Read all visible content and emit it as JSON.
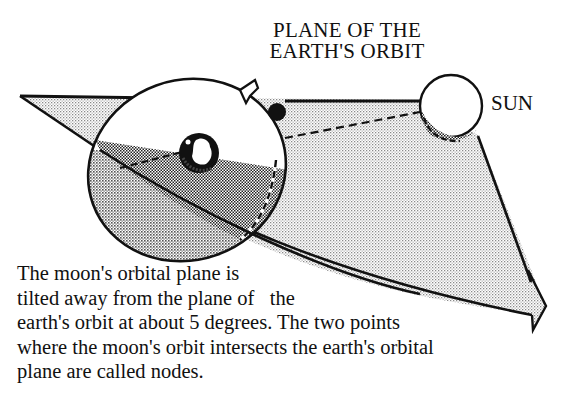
{
  "diagram": {
    "title_lines": [
      "PLANE OF THE",
      "EARTH'S ORBIT"
    ],
    "labels": {
      "sun": "SUN"
    },
    "caption_lines": [
      "The moon's orbital plane is",
      "tilted away from the plane of   the",
      "earth's orbit at about 5 degrees. The two points",
      "where the moon's orbit intersects the earth's orbital",
      "plane are called nodes."
    ],
    "elements": {
      "earth_orbit_plane": "large stippled arrow-shaped plane pointing lower-right",
      "moon_orbit": "tilted ellipse around the earth",
      "earth": "small globe at center of moon's orbit",
      "moon": "solid black disk on moon's orbit",
      "sun": "white circle at upper right with shadow",
      "direction_arrow": "small arrowhead on moon's orbit"
    },
    "colors": {
      "ink": "#111111",
      "light_stipple": "#d9d9d9",
      "dark_stipple": "#9a9a9a",
      "paper": "#ffffff"
    }
  }
}
